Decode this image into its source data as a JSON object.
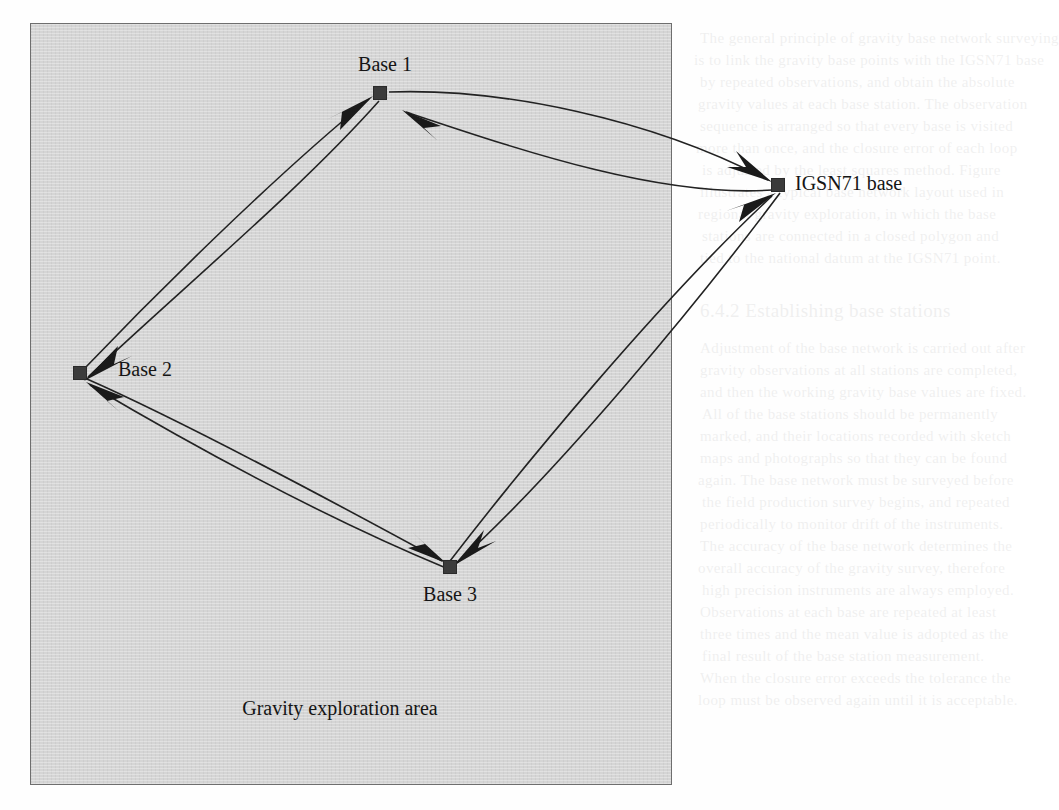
{
  "figure": {
    "kind": "base-station-network-diagram",
    "area_box": {
      "label": "Gravity exploration area",
      "fill_color": "#d5d5d5",
      "border_color": "#6e6e6e",
      "x": 30,
      "y": 23,
      "width": 642,
      "height": 762
    },
    "nodes": [
      {
        "id": "base1",
        "label": "Base 1",
        "x": 380,
        "y": 93,
        "inside_area": true,
        "label_position": "above"
      },
      {
        "id": "base2",
        "label": "Base 2",
        "x": 80,
        "y": 373,
        "inside_area": true,
        "label_position": "right"
      },
      {
        "id": "base3",
        "label": "Base 3",
        "x": 450,
        "y": 567,
        "inside_area": true,
        "label_position": "below"
      },
      {
        "id": "igsn71",
        "label": "IGSN71 base",
        "x": 778,
        "y": 185,
        "inside_area": false,
        "label_position": "right"
      }
    ],
    "links": [
      {
        "from": "base1",
        "to": "igsn71",
        "directed": true,
        "curve": "bow-out"
      },
      {
        "from": "igsn71",
        "to": "base1",
        "directed": true,
        "curve": "bow-out"
      },
      {
        "from": "base2",
        "to": "base1",
        "directed": true,
        "curve": "bow-out"
      },
      {
        "from": "base1",
        "to": "base2",
        "directed": true,
        "curve": "bow-out"
      },
      {
        "from": "base2",
        "to": "base3",
        "directed": true,
        "curve": "bow-out"
      },
      {
        "from": "base3",
        "to": "base2",
        "directed": true,
        "curve": "bow-out"
      },
      {
        "from": "base3",
        "to": "igsn71",
        "directed": true,
        "curve": "bow-out"
      },
      {
        "from": "igsn71",
        "to": "base3",
        "directed": true,
        "curve": "bow-out"
      }
    ],
    "node_marker": {
      "shape": "square",
      "size": 13,
      "color": "#3b3b3b"
    },
    "link_color": "#222222"
  },
  "labels": {
    "base1": "Base 1",
    "base2": "Base 2",
    "base3": "Base 3",
    "igsn71": "IGSN71 base",
    "area": "Gravity exploration area"
  },
  "page_bleed": {
    "note": "faint show-through text from the reverse of the scanned page",
    "lines": [
      {
        "text": "The general principle of gravity base network surveying",
        "x": 700,
        "y": 30,
        "size": 15,
        "flip": false
      },
      {
        "text": "is to link the gravity base points with the IGSN71 base",
        "x": 694,
        "y": 52,
        "size": 15,
        "flip": false
      },
      {
        "text": "by repeated observations, and obtain the absolute",
        "x": 700,
        "y": 74,
        "size": 15,
        "flip": false
      },
      {
        "text": "gravity values at each base station. The observation",
        "x": 698,
        "y": 96,
        "size": 15,
        "flip": false
      },
      {
        "text": "sequence is arranged so that every base is visited",
        "x": 700,
        "y": 118,
        "size": 15,
        "flip": false
      },
      {
        "text": "more than once, and the closure error of each loop",
        "x": 696,
        "y": 140,
        "size": 15,
        "flip": false
      },
      {
        "text": "is adjusted by the least squares method. Figure",
        "x": 702,
        "y": 162,
        "size": 15,
        "flip": false
      },
      {
        "text": "illustrates a typical base network layout used in",
        "x": 700,
        "y": 184,
        "size": 15,
        "flip": false
      },
      {
        "text": "regional gravity exploration, in which the base",
        "x": 698,
        "y": 206,
        "size": 15,
        "flip": false
      },
      {
        "text": "stations are connected in a closed polygon and",
        "x": 702,
        "y": 228,
        "size": 15,
        "flip": false
      },
      {
        "text": "tied to the national datum at the IGSN71 point.",
        "x": 700,
        "y": 250,
        "size": 15,
        "flip": false
      },
      {
        "text": "6.4.2   Establishing base stations",
        "x": 700,
        "y": 300,
        "size": 19,
        "flip": false
      },
      {
        "text": "Adjustment of the base network is carried out after",
        "x": 700,
        "y": 340,
        "size": 15,
        "flip": false
      },
      {
        "text": "gravity observations at all stations are completed,",
        "x": 700,
        "y": 362,
        "size": 15,
        "flip": false
      },
      {
        "text": "and then the working gravity base values are fixed.",
        "x": 700,
        "y": 384,
        "size": 15,
        "flip": false
      },
      {
        "text": "All of the base stations should be permanently",
        "x": 702,
        "y": 406,
        "size": 15,
        "flip": false
      },
      {
        "text": "marked, and their locations recorded with sketch",
        "x": 700,
        "y": 428,
        "size": 15,
        "flip": false
      },
      {
        "text": "maps and photographs so that they can be found",
        "x": 700,
        "y": 450,
        "size": 15,
        "flip": false
      },
      {
        "text": "again. The base network must be surveyed before",
        "x": 698,
        "y": 472,
        "size": 15,
        "flip": false
      },
      {
        "text": "the field production survey begins, and repeated",
        "x": 702,
        "y": 494,
        "size": 15,
        "flip": false
      },
      {
        "text": "periodically to monitor drift of the instruments.",
        "x": 700,
        "y": 516,
        "size": 15,
        "flip": false
      },
      {
        "text": "The accuracy of the base network determines the",
        "x": 700,
        "y": 538,
        "size": 15,
        "flip": false
      },
      {
        "text": "overall accuracy of the gravity survey, therefore",
        "x": 698,
        "y": 560,
        "size": 15,
        "flip": false
      },
      {
        "text": "high precision instruments are always employed.",
        "x": 702,
        "y": 582,
        "size": 15,
        "flip": false
      },
      {
        "text": "Observations at each base are repeated at least",
        "x": 700,
        "y": 604,
        "size": 15,
        "flip": false
      },
      {
        "text": "three times and the mean value is adopted as the",
        "x": 700,
        "y": 626,
        "size": 15,
        "flip": false
      },
      {
        "text": "final result of the base station measurement.",
        "x": 702,
        "y": 648,
        "size": 15,
        "flip": false
      },
      {
        "text": "When the closure error exceeds the tolerance the",
        "x": 700,
        "y": 670,
        "size": 15,
        "flip": false
      },
      {
        "text": "loop must be observed again until it is acceptable.",
        "x": 698,
        "y": 692,
        "size": 15,
        "flip": false
      },
      {
        "text": "MOLEK ALL IDE SEGN GOOSE, DE SANLINDER, VISAMBRIN",
        "x": 40,
        "y": 752,
        "size": 15,
        "flip": true
      },
      {
        "text": "Blanket of the measurements taken in the area",
        "x": 60,
        "y": 30,
        "size": 15,
        "flip": true
      },
      {
        "text": "repeated survey lines crossing the region",
        "x": 55,
        "y": 116,
        "size": 15,
        "flip": true
      },
      {
        "text": "station values referred to the national net",
        "x": 60,
        "y": 208,
        "size": 15,
        "flip": true
      }
    ]
  }
}
